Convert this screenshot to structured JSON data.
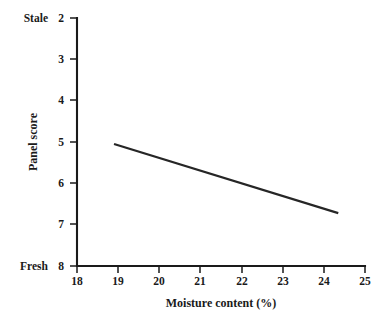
{
  "chart_data": {
    "type": "line",
    "title": "",
    "xlabel": "Moisture content (%)",
    "ylabel": "Panel score",
    "xlim": [
      18,
      25
    ],
    "ylim": [
      2,
      8
    ],
    "y_inverted": true,
    "grid": false,
    "legend": "none",
    "x_ticks": [
      "18",
      "19",
      "20",
      "21",
      "22",
      "23",
      "24",
      "25"
    ],
    "y_ticks": [
      "2",
      "3",
      "4",
      "5",
      "6",
      "7",
      "8"
    ],
    "y_axis_anchors": {
      "top_label": "Stale",
      "top_value": "2",
      "bottom_label": "Fresh",
      "bottom_value": "8"
    },
    "series": [
      {
        "name": "Panel score vs moisture content",
        "x": [
          18.9,
          24.35
        ],
        "values": [
          5.05,
          6.72
        ]
      }
    ],
    "colors": {
      "line": "#262626",
      "axis": "#1a1a1a",
      "background": "#ffffff"
    }
  }
}
